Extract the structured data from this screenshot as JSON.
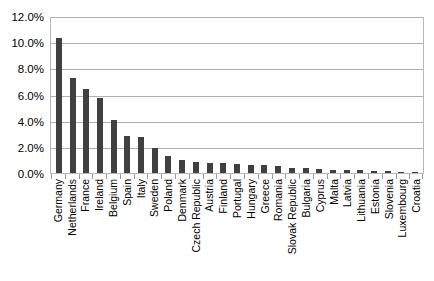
{
  "chart_data": {
    "type": "bar",
    "title": "",
    "xlabel": "",
    "ylabel": "",
    "ylim": [
      0,
      12
    ],
    "ytick_labels": [
      "12.0%",
      "10.0%",
      "8.0%",
      "6.0%",
      "4.0%",
      "2.0%",
      "0.0%"
    ],
    "ytick_values": [
      12,
      10,
      8,
      6,
      4,
      2,
      0
    ],
    "grid": true,
    "legend": "none",
    "bar_color": "#404040",
    "gridline_color": "#b0b0b0",
    "plot_border_color": "#b8b8b8",
    "categories": [
      "Germany",
      "Netherlands",
      "France",
      "Ireland",
      "Belgium",
      "Spain",
      "Italy",
      "Sweden",
      "Poland",
      "Denmark",
      "Czech Republic",
      "Austria",
      "Finland",
      "Portugal",
      "Hungary",
      "Greece",
      "Romania",
      "Slovak Republic",
      "Bulgaria",
      "Cyprus",
      "Malta",
      "Latvia",
      "Lithuania",
      "Estonia",
      "Slovenia",
      "Luxembourg",
      "Croatia"
    ],
    "values": [
      10.3,
      7.25,
      6.4,
      5.75,
      4.05,
      2.8,
      2.75,
      1.95,
      1.3,
      1.0,
      0.85,
      0.8,
      0.75,
      0.7,
      0.65,
      0.6,
      0.5,
      0.4,
      0.35,
      0.3,
      0.25,
      0.22,
      0.2,
      0.15,
      0.12,
      0.1,
      0.08
    ]
  }
}
